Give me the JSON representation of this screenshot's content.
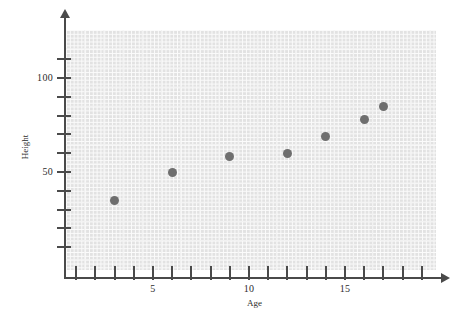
{
  "chart_data": {
    "type": "scatter",
    "title": "",
    "xlabel": "Age",
    "ylabel": "Height",
    "xlim": [
      0,
      19.6
    ],
    "ylim": [
      0,
      128
    ],
    "grid": true,
    "legend": null,
    "x_ticks_major": [
      5,
      10,
      15
    ],
    "x_tick_labels": [
      "5",
      "10",
      "15"
    ],
    "x_ticks_all": [
      1,
      2,
      3,
      4,
      5,
      6,
      7,
      8,
      9,
      10,
      11,
      12,
      13,
      14,
      15,
      16,
      17,
      18,
      19
    ],
    "y_ticks_major": [
      50,
      100
    ],
    "y_tick_labels": [
      "50",
      "100"
    ],
    "y_ticks_all": [
      10,
      20,
      30,
      40,
      50,
      60,
      70,
      80,
      90,
      100,
      110
    ],
    "point_color": "#6e6e6e",
    "grid_color": "#f2f2f2",
    "plot_background": "#e2e2e2",
    "axis_color": "#4a4a4a",
    "points": [
      {
        "x": 3,
        "y": 35
      },
      {
        "x": 6,
        "y": 50
      },
      {
        "x": 9,
        "y": 58
      },
      {
        "x": 12,
        "y": 60
      },
      {
        "x": 14,
        "y": 69
      },
      {
        "x": 16,
        "y": 78
      },
      {
        "x": 17,
        "y": 85
      }
    ]
  },
  "axes": {
    "x_title": "Age",
    "y_title": "Height"
  }
}
